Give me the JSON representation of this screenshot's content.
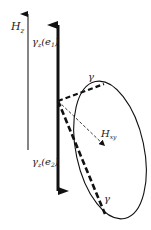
{
  "labels": {
    "h_z": "H",
    "h_z_sub": "z",
    "gamma_e1": "γ",
    "gamma_e1_sub": "z",
    "gamma_e1_arg": "(e",
    "gamma_e1_arg_sub": "1",
    "gamma_e1_close": ")",
    "gamma_e2": "γ",
    "gamma_e2_sub": "z",
    "gamma_e2_arg": "(e",
    "gamma_e2_arg_sub": "2",
    "gamma_e2_close": ")",
    "gamma_top": "γ",
    "h_xy": "H",
    "h_xy_sub": "xy",
    "gamma_bottom": "γ"
  },
  "colors": {
    "ink": "#111111"
  }
}
